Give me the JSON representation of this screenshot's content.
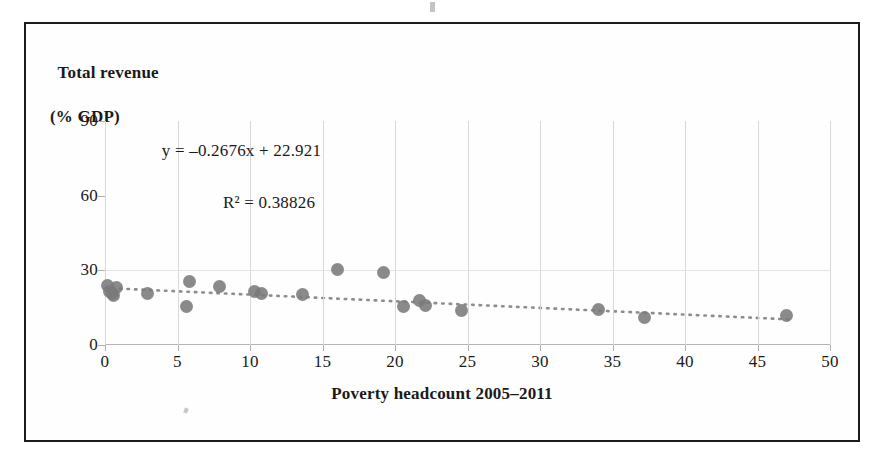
{
  "figure": {
    "y_axis_title_line1": "Total revenue",
    "y_axis_title_line2": "(% GDP)",
    "x_axis_title": "Poverty headcount 2005–2011",
    "equation": "y = –0.2676x + 22.921",
    "r_squared": "R² = 0.38826",
    "marker_color": "#7a7a7a",
    "gridline_color": "#d9d9d9",
    "border_color": "#1c1c1c"
  },
  "chart_data": {
    "type": "scatter",
    "title": "",
    "xlabel": "Poverty headcount 2005–2011",
    "ylabel": "Total revenue (% GDP)",
    "xlim": [
      0,
      50
    ],
    "ylim": [
      0,
      90
    ],
    "xticks": [
      0,
      5,
      10,
      15,
      20,
      25,
      30,
      35,
      40,
      45,
      50
    ],
    "yticks": [
      0,
      30,
      60,
      90
    ],
    "xtick_labels": [
      "0",
      "5",
      "10",
      "15",
      "20",
      "25",
      "30",
      "35",
      "40",
      "45",
      "50"
    ],
    "ytick_labels": [
      "0",
      "30",
      "60",
      "90"
    ],
    "grid": "vertical-and-horizontal-light",
    "legend": "none",
    "annotations": [
      "y = –0.2676x + 22.921",
      "R² = 0.38826"
    ],
    "trendline": {
      "type": "linear-dotted",
      "slope": -0.2676,
      "intercept": 22.921,
      "r_squared": 0.38826,
      "x_start": 0,
      "x_end": 47.5
    },
    "points": [
      {
        "x": 0.2,
        "y": 24.0
      },
      {
        "x": 0.3,
        "y": 21.5
      },
      {
        "x": 0.5,
        "y": 20.5
      },
      {
        "x": 0.8,
        "y": 23.0
      },
      {
        "x": 0.6,
        "y": 19.8
      },
      {
        "x": 2.9,
        "y": 20.5
      },
      {
        "x": 5.6,
        "y": 15.5
      },
      {
        "x": 5.8,
        "y": 25.5
      },
      {
        "x": 7.9,
        "y": 23.5
      },
      {
        "x": 10.3,
        "y": 21.5
      },
      {
        "x": 10.8,
        "y": 20.8
      },
      {
        "x": 13.6,
        "y": 20.2
      },
      {
        "x": 16.0,
        "y": 30.5
      },
      {
        "x": 19.2,
        "y": 29.0
      },
      {
        "x": 20.6,
        "y": 15.5
      },
      {
        "x": 21.7,
        "y": 18.0
      },
      {
        "x": 22.1,
        "y": 16.0
      },
      {
        "x": 24.6,
        "y": 13.8
      },
      {
        "x": 34.0,
        "y": 14.2
      },
      {
        "x": 37.2,
        "y": 11.0
      },
      {
        "x": 47.0,
        "y": 12.0
      }
    ]
  }
}
